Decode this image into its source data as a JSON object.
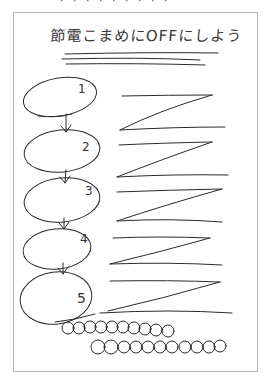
{
  "clipped_header_text": "· · · · · · · · ·",
  "title": "節電こまめにOFFにしよう",
  "steps": [
    {
      "label": "1"
    },
    {
      "label": "2"
    },
    {
      "label": "3"
    },
    {
      "label": "4"
    },
    {
      "label": "5"
    }
  ],
  "placeholder_lines": "zigzag scribble text placeholders beside each step",
  "footer": "row of looped scribbles (placeholder text)",
  "colors": {
    "ink": "#2a2a2a",
    "paper_border": "#b8b8b8",
    "background": "#ffffff"
  }
}
